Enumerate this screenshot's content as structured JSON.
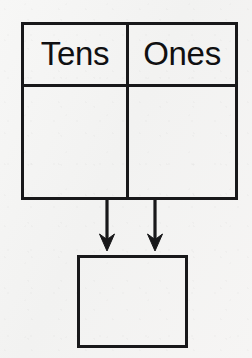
{
  "worksheet": {
    "title": "Place Value Chart",
    "background_color": "#f5f5f4",
    "ink_color": "#18181a"
  },
  "place_value_table": {
    "name": "place-value-table",
    "border_width_px": 3,
    "columns": [
      {
        "key": "tens",
        "header": "Tens",
        "value": ""
      },
      {
        "key": "ones",
        "header": "Ones",
        "value": ""
      }
    ],
    "header_row": {
      "labels": [
        "Tens",
        "Ones"
      ]
    },
    "entry_row": {
      "values": [
        "",
        ""
      ]
    }
  },
  "arrows": {
    "name": "combine-arrows",
    "direction": "down",
    "count": 2,
    "color": "#18181a",
    "items": [
      {
        "key": "tens-arrow",
        "from_column": "Tens",
        "x": 107,
        "y_start": 200,
        "y_end": 250
      },
      {
        "key": "ones-arrow",
        "from_column": "Ones",
        "x": 155,
        "y_start": 200,
        "y_end": 250
      }
    ]
  },
  "answer_box": {
    "name": "answer-box",
    "value": "",
    "placeholder": "",
    "border_width_px": 3
  }
}
